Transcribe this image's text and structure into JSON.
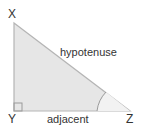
{
  "diagram": {
    "type": "right-triangle",
    "vertices": {
      "top": "X",
      "right_angle": "Y",
      "acute": "Z"
    },
    "sides": {
      "hypotenuse": "hypotenuse",
      "adjacent": "adjacent"
    },
    "markers": {
      "right_angle_at": "Y",
      "angle_arc_at": "Z"
    },
    "colors": {
      "fill": "#e6e6e6",
      "stroke": "#b5b5b5",
      "text": "#333333"
    }
  }
}
